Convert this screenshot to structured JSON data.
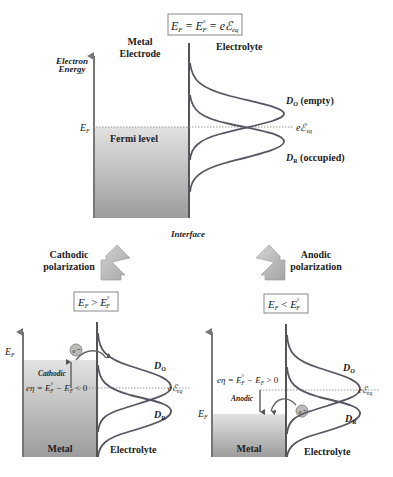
{
  "top": {
    "formula": "E_F = E_F° = eℰ_eq",
    "formula_parts": {
      "a": "E",
      "a_sub": "F",
      "eq1": " = ",
      "b": "E",
      "b_sup": "°",
      "b_sub": "F",
      "eq2": " = ",
      "c": "eℰ",
      "c_sub": "eq"
    },
    "metal_label_line1": "Metal",
    "metal_label_line2": "Electrode",
    "electrolyte_label": "Electrolyte",
    "axis_label_line1": "Electron",
    "axis_label_line2": "Energy",
    "ef_label": "E",
    "ef_sub": "F",
    "fermi_level_label": "Fermi level",
    "eq_label": "eℰ",
    "eq_sub": "eq",
    "do_label": "D",
    "do_sub": "O",
    "do_suffix": " (empty)",
    "dr_label": "D",
    "dr_sub": "R",
    "dr_suffix": " (occupied)",
    "interface_label": "Interface"
  },
  "arrows": {
    "cathodic_line1": "Cathodic",
    "cathodic_line2": "polarization",
    "anodic_line1": "Anodic",
    "anodic_line2": "polarization"
  },
  "cathodic": {
    "condition": {
      "a": "E",
      "a_sub": "F",
      "op": " > ",
      "b": "E",
      "b_sup": "°",
      "b_sub": "F"
    },
    "ef_label": "E",
    "ef_sub": "F",
    "electron": "e⁻",
    "process_label": "Cathodic",
    "overpotential": "eη = E°_F − E_F < 0",
    "op_parts": {
      "a": "eη = E",
      "a_sup": "°",
      "a_sub": "F",
      "mid": " − E",
      "mid_sub": "F",
      "end": " < 0"
    },
    "do_label": "D",
    "do_sub": "O",
    "dr_label": "D",
    "dr_sub": "R",
    "eq_label": "eℰ",
    "eq_sub": "eq",
    "metal_label": "Metal",
    "electrolyte_label": "Electrolyte"
  },
  "anodic": {
    "condition": {
      "a": "E",
      "a_sub": "F",
      "op": " < ",
      "b": "E",
      "b_sup": "°",
      "b_sub": "F"
    },
    "ef_label": "E",
    "ef_sub": "F",
    "electron": "e⁻",
    "process_label": "Anodic",
    "overpotential": "eη = E°_F − E_F > 0",
    "op_parts": {
      "a": "eη = E",
      "a_sup": "°",
      "a_sub": "F",
      "mid": " − E",
      "mid_sub": "F",
      "end": " > 0"
    },
    "do_label": "D",
    "do_sub": "O",
    "dr_label": "D",
    "dr_sub": "R",
    "eq_label": "eℰ",
    "eq_sub": "eq",
    "metal_label": "Metal",
    "electrolyte_label": "Electrolyte"
  },
  "colors": {
    "curve": "#5a5560",
    "axis": "#777777",
    "metal_top": "#dcdcdc",
    "metal_bottom": "#9a9a9a",
    "arrow_fill": "#b5b5b5"
  }
}
